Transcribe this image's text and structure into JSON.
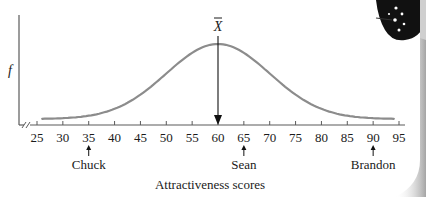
{
  "chart_data": {
    "type": "line",
    "title": "",
    "xlabel": "Attractiveness scores",
    "ylabel": "f",
    "xlim": [
      25,
      95
    ],
    "x_ticks": [
      25,
      30,
      35,
      40,
      45,
      50,
      55,
      60,
      65,
      70,
      75,
      80,
      85,
      90,
      95
    ],
    "x_tick_labels": [
      "25",
      "30",
      "35",
      "40",
      "45",
      "50",
      "55",
      "60",
      "65",
      "70",
      "75",
      "80",
      "85",
      "90",
      "95"
    ],
    "axis_break": true,
    "grid": false,
    "legend": null,
    "distribution": {
      "shape": "normal",
      "mean": 60,
      "sd_approx": 10,
      "x_start": 26,
      "x_end": 94
    },
    "series": [
      {
        "name": "frequency curve",
        "color": "#8c8c8c",
        "x": [
          26,
          30,
          35,
          40,
          45,
          50,
          55,
          60,
          65,
          70,
          75,
          80,
          85,
          90,
          94
        ],
        "y_relative": [
          0.06,
          0.07,
          0.09,
          0.14,
          0.3,
          0.62,
          0.9,
          1.0,
          0.9,
          0.62,
          0.3,
          0.14,
          0.09,
          0.07,
          0.06
        ]
      }
    ],
    "annotations": [
      {
        "type": "mean-line",
        "label": "X̄",
        "x": 60,
        "description": "vertical arrow from peak down to x-axis at the mean"
      },
      {
        "type": "marker",
        "label": "Chuck",
        "x": 35
      },
      {
        "type": "marker",
        "label": "Sean",
        "x": 65
      },
      {
        "type": "marker",
        "label": "Brandon",
        "x": 90
      }
    ]
  },
  "labels": {
    "y_axis": "f",
    "x_axis": "Attractiveness scores",
    "mean_symbol": "X",
    "people": [
      {
        "name": "Chuck",
        "score": 35
      },
      {
        "name": "Sean",
        "score": 65
      },
      {
        "name": "Brandon",
        "score": 90
      }
    ]
  },
  "colors": {
    "curve": "#8c8c8c",
    "axis": "#5a5a5a",
    "text": "#1a1a1a",
    "arrow": "#111111"
  }
}
